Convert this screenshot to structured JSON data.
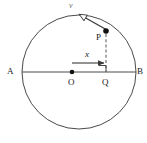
{
  "figure": {
    "type": "geometry-diagram",
    "width": 147,
    "height": 143,
    "background_color": "#ffffff",
    "stroke_color": "#3a3a3a",
    "dash_color": "#8a8a8a",
    "label_color": "#1a1a1a"
  },
  "labels": {
    "a": "A",
    "b": "B",
    "o": "O",
    "p": "P",
    "q": "Q",
    "x": "x",
    "v": "v"
  },
  "geometry": {
    "circle": {
      "cx": 79,
      "cy": 72,
      "r": 57
    },
    "diameter": {
      "x1": 22,
      "y1": 72,
      "x2": 136,
      "y2": 72
    },
    "center_point": {
      "cx": 72,
      "cy": 72,
      "r": 2.3
    },
    "point_p": {
      "cx": 106,
      "cy": 31,
      "r": 2.6
    },
    "point_q": {
      "x": 106,
      "y": 72
    },
    "perpendicular_dashed": {
      "x1": 106,
      "y1": 33,
      "x2": 106,
      "y2": 72
    },
    "right_angle_marker": {
      "x": 99,
      "y": 65,
      "size": 7
    },
    "x_arrow": {
      "x1": 72,
      "y1": 63,
      "x2": 105,
      "y2": 63
    },
    "velocity_arrow": {
      "x1": 107,
      "y1": 30,
      "x2": 77,
      "y2": 13
    }
  },
  "label_positions": {
    "a": {
      "left": 7,
      "top": 67
    },
    "b": {
      "left": 137,
      "top": 67
    },
    "o": {
      "left": 68,
      "top": 78
    },
    "p": {
      "left": 96,
      "top": 33
    },
    "q": {
      "left": 102,
      "top": 78
    },
    "x": {
      "left": 85,
      "top": 50
    },
    "v": {
      "left": 69,
      "top": 1
    }
  }
}
